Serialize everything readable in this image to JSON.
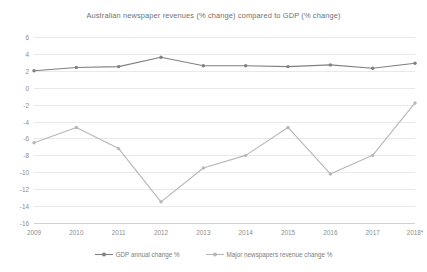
{
  "chart_data": {
    "type": "line",
    "title": "Australian newspaper revenues (% change) compared to GDP (% change)",
    "xlabel": "",
    "ylabel": "",
    "categories": [
      "2009",
      "2010",
      "2011",
      "2012",
      "2013",
      "2014",
      "2015",
      "2016",
      "2017",
      "2018*"
    ],
    "ylim": [
      -16,
      6
    ],
    "ytick_step": 2,
    "yticks": [
      "6",
      "4",
      "2",
      "0",
      "-2",
      "-4",
      "-6",
      "-8",
      "-10",
      "-12",
      "-14",
      "-16"
    ],
    "ytick_values": [
      6,
      4,
      2,
      0,
      -2,
      -4,
      -6,
      -8,
      -10,
      -12,
      -14,
      -16
    ],
    "grid": true,
    "legend_position": "bottom-center",
    "series": [
      {
        "name": "GDP annual change %",
        "color": "#808080",
        "marker": "circle",
        "values": [
          2.0,
          2.4,
          2.5,
          3.6,
          2.6,
          2.6,
          2.5,
          2.7,
          2.3,
          2.9
        ]
      },
      {
        "name": "Major newspapers revenue change %",
        "color": "#b7b7b7",
        "marker": "circle",
        "values": [
          -6.5,
          -4.7,
          -7.2,
          -13.5,
          -9.5,
          -8.0,
          -4.7,
          -10.2,
          -8.0,
          -1.8
        ]
      }
    ]
  }
}
